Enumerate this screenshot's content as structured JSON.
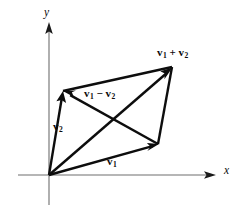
{
  "figure": {
    "type": "vector-parallelogram-diagram",
    "background_color": "#ffffff",
    "axis_color": "#6e6e6e",
    "vector_color": "#0d0d0d",
    "origin": {
      "x": 49,
      "y": 175
    },
    "axes": {
      "x_label": "x",
      "y_label": "y",
      "x_axis": {
        "x1": 18,
        "y1": 175,
        "x2": 216,
        "y2": 175
      },
      "y_axis": {
        "x1": 49,
        "y1": 205,
        "x2": 49,
        "y2": 22
      }
    },
    "points": {
      "origin": {
        "x": 49,
        "y": 175
      },
      "v1_tip": {
        "x": 158,
        "y": 144
      },
      "v2_tip": {
        "x": 63,
        "y": 91
      },
      "sum_tip": {
        "x": 172,
        "y": 67
      }
    },
    "vectors": [
      {
        "name": "v1",
        "label": "v1",
        "from": "origin",
        "to": "v1_tip",
        "arrow": true
      },
      {
        "name": "v2",
        "label": "v2",
        "from": "origin",
        "to": "v2_tip",
        "arrow": true
      },
      {
        "name": "v1+v2",
        "label": "v1 + v2",
        "from": "origin",
        "to": "sum_tip",
        "arrow": true
      },
      {
        "name": "v1-v2",
        "label": "v1 - v2",
        "from": "v1_tip",
        "to": "v2_tip",
        "arrow": true
      },
      {
        "name": "side-top-left",
        "from": "v2_tip",
        "to": "sum_tip",
        "arrow": false
      },
      {
        "name": "side-bottom-right",
        "from": "v1_tip",
        "to": "sum_tip",
        "arrow": false
      }
    ],
    "labels": {
      "sum": {
        "base": "v",
        "sub1": "1",
        "operator": "+",
        "sub2": "2"
      },
      "diff": {
        "base": "v",
        "sub1": "1",
        "operator": "−",
        "sub2": "2"
      },
      "v1": {
        "base": "v",
        "sub": "1"
      },
      "v2": {
        "base": "v",
        "sub": "2"
      },
      "x_axis": "x",
      "y_axis": "y"
    }
  }
}
